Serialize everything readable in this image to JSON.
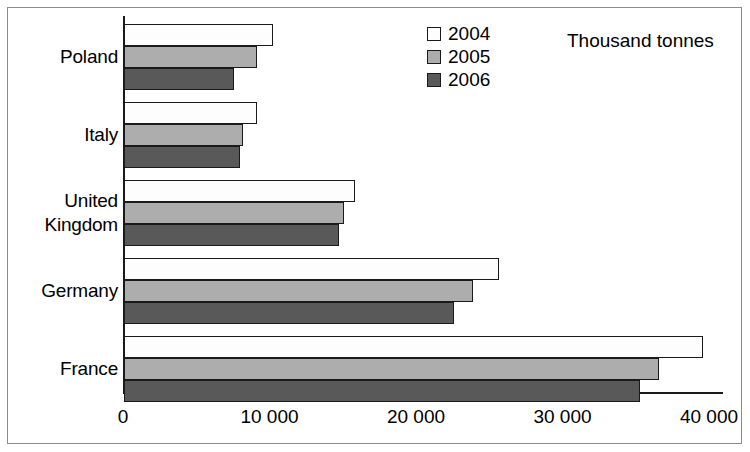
{
  "chart_data": {
    "type": "bar",
    "orientation": "horizontal",
    "title": "",
    "unit_label": "Thousand tonnes",
    "xlabel": "",
    "ylabel": "",
    "categories": [
      "Poland",
      "Italy",
      "United Kingdom",
      "Germany",
      "France"
    ],
    "category_lines": [
      [
        "Poland"
      ],
      [
        "Italy"
      ],
      [
        "United",
        "Kingdom"
      ],
      [
        "Germany"
      ],
      [
        "France"
      ]
    ],
    "series": [
      {
        "name": "2004",
        "color": "#fdfdfd",
        "values": [
          10200,
          9050,
          15750,
          25600,
          39500
        ]
      },
      {
        "name": "2005",
        "color": "#adadad",
        "values": [
          9100,
          8100,
          15000,
          23800,
          36500
        ]
      },
      {
        "name": "2006",
        "color": "#595959",
        "values": [
          7500,
          7900,
          14700,
          22500,
          35200
        ]
      }
    ],
    "xlim": [
      0,
      40000
    ],
    "xticks": [
      0,
      10000,
      20000,
      30000,
      40000
    ],
    "xtick_labels": [
      "0",
      "10 000",
      "20 000",
      "30 000",
      "40 000"
    ],
    "grid": false,
    "legend_position": "top-center",
    "axis_color": "#1a1a1a",
    "bar_border_color": "#1a1a1a",
    "frame_color": "#8c8c8c"
  },
  "legend": {
    "entries": [
      {
        "label": "2004"
      },
      {
        "label": "2005"
      },
      {
        "label": "2006"
      }
    ]
  }
}
